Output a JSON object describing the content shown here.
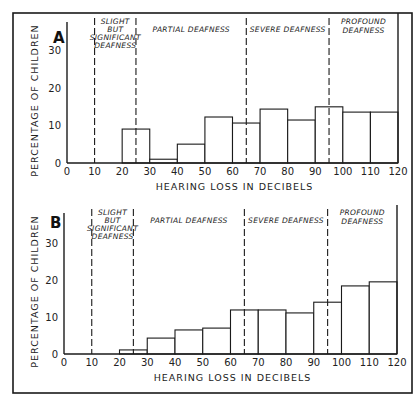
{
  "figure": {
    "frame": {
      "x": 13,
      "y": 13,
      "w": 399,
      "h": 380
    }
  },
  "chart_data": [
    {
      "type": "bar",
      "panel_label": "A",
      "title": "",
      "xlabel": "HEARING LOSS IN DECIBELS",
      "ylabel": "PERCENTAGE OF CHILDREN",
      "x_ticks": [
        "0",
        "10",
        "20",
        "30",
        "40",
        "50",
        "60",
        "70",
        "80",
        "90",
        "100",
        "110",
        "120"
      ],
      "y_ticks": [
        "0",
        "10",
        "20",
        "30"
      ],
      "xlim": [
        0,
        120
      ],
      "ylim": [
        0,
        35
      ],
      "grid": false,
      "legend": null,
      "bins": [
        [
          20,
          30
        ],
        [
          30,
          40
        ],
        [
          40,
          50
        ],
        [
          50,
          60
        ],
        [
          60,
          70
        ],
        [
          70,
          80
        ],
        [
          80,
          90
        ],
        [
          90,
          100
        ],
        [
          100,
          110
        ],
        [
          110,
          120
        ]
      ],
      "categories": [
        "20-30",
        "30-40",
        "40-50",
        "50-60",
        "60-70",
        "70-80",
        "80-90",
        "90-100",
        "100-110",
        "110-120"
      ],
      "values": [
        9,
        1,
        5,
        12.2,
        10.6,
        14.3,
        11.4,
        14.9,
        13.5,
        13.5
      ],
      "regions": [
        {
          "label": [
            "SLIGHT",
            "BUT",
            "SIGNIFICANT",
            "DEAFNESS"
          ],
          "from": 10,
          "to": 25
        },
        {
          "label": [
            "PARTIAL DEAFNESS"
          ],
          "from": 25,
          "to": 65
        },
        {
          "label": [
            "SEVERE DEAFNESS"
          ],
          "from": 65,
          "to": 95
        },
        {
          "label": [
            "PROFOUND",
            "DEAFNESS"
          ],
          "from": 95,
          "to": 120
        }
      ],
      "dividers_db": [
        10,
        25,
        65,
        95
      ],
      "layout": {
        "x0": 67,
        "x120": 398,
        "y0": 163,
        "px_per_unit": 3.77,
        "top": 22,
        "right_line_top": 13
      }
    },
    {
      "type": "bar",
      "panel_label": "B",
      "title": "",
      "xlabel": "HEARING LOSS IN DECIBELS",
      "ylabel": "PERCENTAGE OF CHILDREN",
      "x_ticks": [
        "0",
        "10",
        "20",
        "30",
        "40",
        "50",
        "60",
        "70",
        "80",
        "90",
        "100",
        "110",
        "120"
      ],
      "y_ticks": [
        "0",
        "10",
        "20",
        "30"
      ],
      "xlim": [
        0,
        120
      ],
      "ylim": [
        0,
        35
      ],
      "grid": false,
      "legend": null,
      "bins": [
        [
          20,
          30
        ],
        [
          30,
          40
        ],
        [
          40,
          50
        ],
        [
          50,
          60
        ],
        [
          60,
          70
        ],
        [
          70,
          80
        ],
        [
          80,
          90
        ],
        [
          90,
          100
        ],
        [
          100,
          110
        ],
        [
          110,
          120
        ]
      ],
      "categories": [
        "20-30",
        "30-40",
        "40-50",
        "50-60",
        "60-70",
        "70-80",
        "80-90",
        "90-100",
        "100-110",
        "110-120"
      ],
      "values": [
        1.1,
        4.3,
        6.5,
        7,
        11.9,
        11.9,
        11.1,
        14,
        18.4,
        19.5
      ],
      "regions": [
        {
          "label": [
            "SLIGHT",
            "BUT",
            "SIGNIFICANT",
            "DEAFNESS"
          ],
          "from": 10,
          "to": 25
        },
        {
          "label": [
            "PARTIAL DEAFNESS"
          ],
          "from": 25,
          "to": 65
        },
        {
          "label": [
            "SEVERE DEAFNESS"
          ],
          "from": 65,
          "to": 95
        },
        {
          "label": [
            "PROFOUND",
            "DEAFNESS"
          ],
          "from": 95,
          "to": 120
        }
      ],
      "dividers_db": [
        10,
        25,
        65,
        95
      ],
      "layout": {
        "x0": 64,
        "x120": 397,
        "y0": 354,
        "px_per_unit": 3.7,
        "top": 213,
        "right_line_top": 205
      }
    }
  ]
}
